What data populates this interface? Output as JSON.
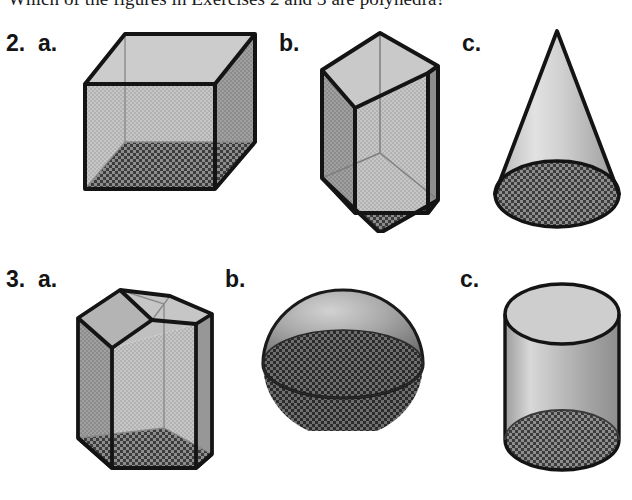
{
  "page": {
    "prompt": "Which of the figures in Exercises 2 and 3 are polyhedra?",
    "background_color": "#ffffff",
    "ink_color": "#141414"
  },
  "exercises": [
    {
      "number_label": "2.",
      "parts": [
        {
          "letter_label": "a.",
          "figure_name": "cube",
          "shape": "cube",
          "is_polyhedron": true
        },
        {
          "letter_label": "b.",
          "figure_name": "pentagonal-prism",
          "shape": "pentagonal prism",
          "is_polyhedron": true
        },
        {
          "letter_label": "c.",
          "figure_name": "cone",
          "shape": "cone",
          "is_polyhedron": false
        }
      ]
    },
    {
      "number_label": "3.",
      "parts": [
        {
          "letter_label": "a.",
          "figure_name": "house-prism",
          "shape": "pentagonal (house) prism",
          "is_polyhedron": true
        },
        {
          "letter_label": "b.",
          "figure_name": "hemisphere",
          "shape": "hemisphere",
          "is_polyhedron": false
        },
        {
          "letter_label": "c.",
          "figure_name": "cylinder",
          "shape": "cylinder",
          "is_polyhedron": false
        }
      ]
    }
  ],
  "labels": {
    "row1_number": "2.",
    "row1_a": "a.",
    "row1_b": "b.",
    "row1_c": "c.",
    "row2_number": "3.",
    "row2_a": "a.",
    "row2_b": "b.",
    "row2_c": "c."
  },
  "palette": {
    "outline": "#141414",
    "light_face": "#c9c9c9",
    "mid_face": "#a8a8a8",
    "dark_face": "#8f8f8f",
    "hatch_dark": "#4a4a4a",
    "hatch_light": "#9a9a9a",
    "interior_line": "#8a8a8a"
  }
}
